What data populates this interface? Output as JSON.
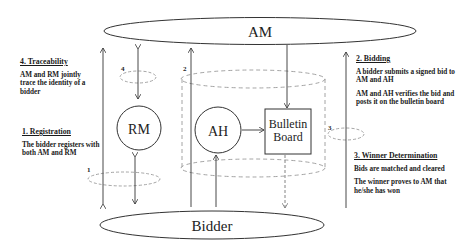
{
  "nodes": {
    "am": "AM",
    "bidder": "Bidder",
    "rm": "RM",
    "ah": "AH",
    "bulletin_line1": "Bulletin",
    "bulletin_line2": "Board"
  },
  "step_markers": {
    "s1": "1",
    "s2": "2",
    "s3": "3",
    "s4": "4"
  },
  "notes": {
    "traceability": {
      "heading": "4. Traceability",
      "lines": [
        "AM and RM jointly trace the identity of a bidder"
      ]
    },
    "registration": {
      "heading": "1. Registration",
      "lines": [
        "The bidder registers with both AM and RM"
      ]
    },
    "bidding": {
      "heading": "2. Bidding",
      "lines": [
        "A bidder submits a signed bid to AM and AH",
        "AM and AH verifies the bid and posts it on the bulletin board"
      ]
    },
    "winner": {
      "heading": "3. Winner Determination",
      "lines": [
        "Bids are matched and cleared",
        "The winner proves to AM that he/she has won"
      ]
    }
  },
  "colors": {
    "line": "#333333",
    "dashed": "#9a9a9a",
    "text": "#1a1a1a"
  }
}
